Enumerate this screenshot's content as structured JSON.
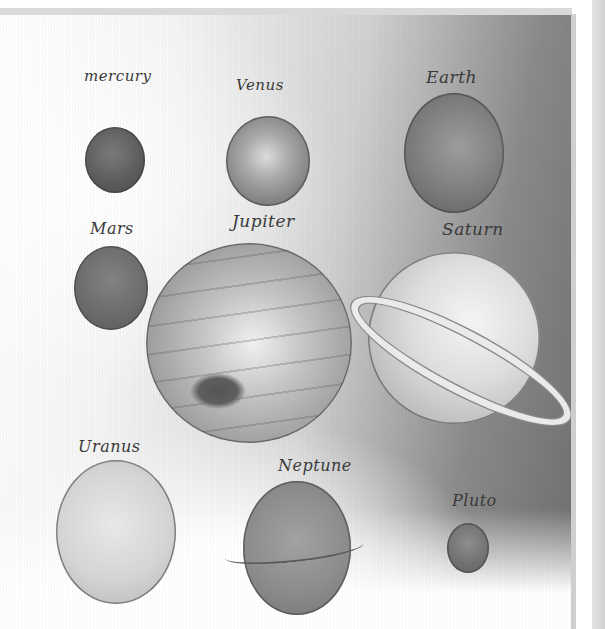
{
  "illustration": {
    "description": "Hand-drawn pencil illustration of the planets of the solar system with handwritten labels",
    "colors": {
      "ink": "#3a3a3a",
      "paper_light": "#ffffff",
      "paper_dark": "#6e6e6e"
    },
    "planets": [
      {
        "label": "mercury",
        "name": "Mercury"
      },
      {
        "label": "Venus",
        "name": "Venus"
      },
      {
        "label": "Earth",
        "name": "Earth"
      },
      {
        "label": "Mars",
        "name": "Mars"
      },
      {
        "label": "Jupiter",
        "name": "Jupiter"
      },
      {
        "label": "Saturn",
        "name": "Saturn"
      },
      {
        "label": "Uranus",
        "name": "Uranus"
      },
      {
        "label": "Neptune",
        "name": "Neptune"
      },
      {
        "label": "Pluto",
        "name": "Pluto"
      }
    ]
  }
}
